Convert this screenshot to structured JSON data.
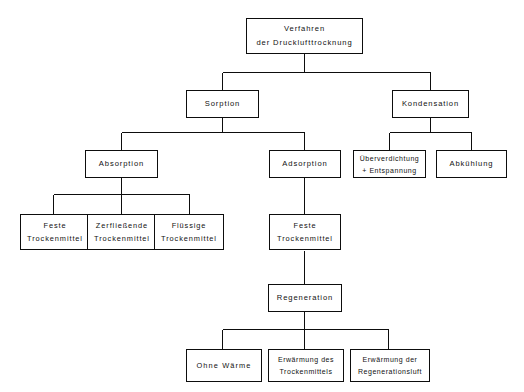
{
  "diagram": {
    "title": "Verfahren der Drucklufttrocknung",
    "language": "de",
    "style": {
      "line_color": "#0d0d0d",
      "box_fill": "#ffffff",
      "text_color": "#111111",
      "background": "#ffffff"
    }
  },
  "nodes": {
    "root": {
      "id": "root",
      "line1": "Verfahren",
      "line2": "der Drucklufttrocknung"
    },
    "sorption": {
      "id": "sorption",
      "line1": "Sorption"
    },
    "kondensation": {
      "id": "kondensation",
      "line1": "Kondensation"
    },
    "absorption": {
      "id": "absorption",
      "line1": "Absorption"
    },
    "adsorption": {
      "id": "adsorption",
      "line1": "Adsorption"
    },
    "ueberverdichtung": {
      "id": "ueberverdichtung",
      "line1": "Überverdichtung",
      "line2": "+ Entspannung"
    },
    "abkuehlung": {
      "id": "abkuehlung",
      "line1": "Abkühlung"
    },
    "feste_trockenmittel_abs": {
      "id": "feste_trockenmittel_abs",
      "line1": "Feste",
      "line2": "Trockenmittel"
    },
    "zerfliessende_trockenmittel": {
      "id": "zerfliessende_trockenmittel",
      "line1": "Zerfließende",
      "line2": "Trockenmittel"
    },
    "fluessige_trockenmittel": {
      "id": "fluessige_trockenmittel",
      "line1": "Flüssige",
      "line2": "Trockenmittel"
    },
    "feste_trockenmittel_ads": {
      "id": "feste_trockenmittel_ads",
      "line1": "Feste",
      "line2": "Trockenmittel"
    },
    "regeneration": {
      "id": "regeneration",
      "line1": "Regeneration"
    },
    "ohne_waerme": {
      "id": "ohne_waerme",
      "line1": "Ohne  Wärme"
    },
    "erwaermung_trockenmittel": {
      "id": "erwaermung_trockenmittel",
      "line1": "Erwärmung des",
      "line2": "Trockenmittels"
    },
    "erwaermung_regenerationsluft": {
      "id": "erwaermung_regenerationsluft",
      "line1": "Erwärmung der",
      "line2": "Regenerationsluft"
    }
  },
  "edges": [
    {
      "from": "root",
      "to": "sorption"
    },
    {
      "from": "root",
      "to": "kondensation"
    },
    {
      "from": "sorption",
      "to": "absorption"
    },
    {
      "from": "sorption",
      "to": "adsorption"
    },
    {
      "from": "kondensation",
      "to": "ueberverdichtung"
    },
    {
      "from": "kondensation",
      "to": "abkuehlung"
    },
    {
      "from": "absorption",
      "to": "feste_trockenmittel_abs"
    },
    {
      "from": "absorption",
      "to": "zerfliessende_trockenmittel"
    },
    {
      "from": "absorption",
      "to": "fluessige_trockenmittel"
    },
    {
      "from": "adsorption",
      "to": "feste_trockenmittel_ads"
    },
    {
      "from": "feste_trockenmittel_ads",
      "to": "regeneration"
    },
    {
      "from": "regeneration",
      "to": "ohne_waerme"
    },
    {
      "from": "regeneration",
      "to": "erwaermung_trockenmittel"
    },
    {
      "from": "regeneration",
      "to": "erwaermung_regenerationsluft"
    }
  ]
}
